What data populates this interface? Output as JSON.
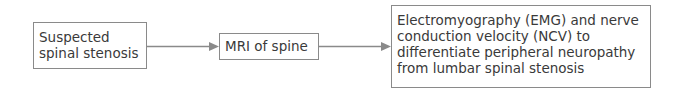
{
  "diagram": {
    "type": "flowchart",
    "direction": "left-to-right",
    "colors": {
      "border": "#8a8a8a",
      "arrow": "#8a8a8a",
      "text": "#3a3a3a",
      "background": "#ffffff"
    },
    "nodes": [
      {
        "id": "n1",
        "label": "Suspected\nspinal stenosis"
      },
      {
        "id": "n2",
        "label": "MRI of spine"
      },
      {
        "id": "n3",
        "label": "Electromyography (EMG) and nerve\nconduction velocity (NCV) to\ndifferentiate peripheral neuropathy\nfrom lumbar spinal stenosis"
      }
    ],
    "edges": [
      {
        "from": "n1",
        "to": "n2"
      },
      {
        "from": "n2",
        "to": "n3"
      }
    ]
  }
}
